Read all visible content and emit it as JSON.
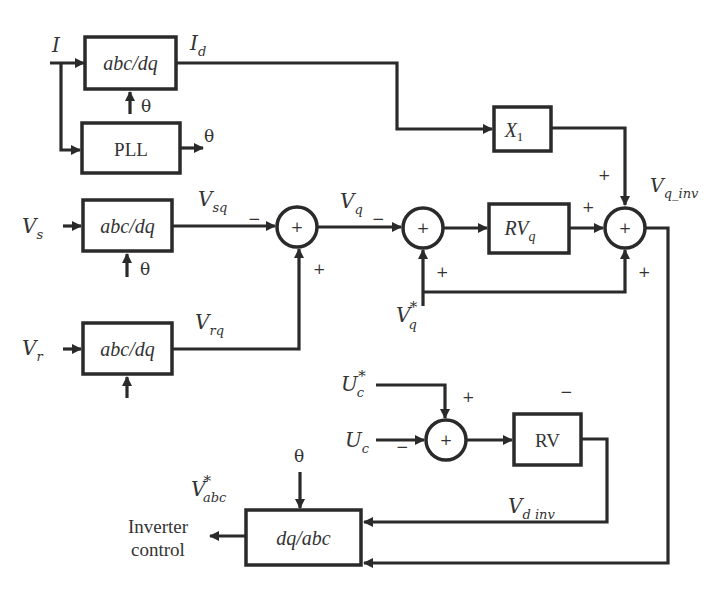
{
  "diagram": {
    "type": "control block diagram",
    "colors": {
      "line": "#2a2a2a",
      "text": "#333333",
      "background": "#ffffff"
    },
    "inputs": {
      "current": {
        "main": "I",
        "sub": ""
      },
      "vs": {
        "main": "V",
        "sub": "s"
      },
      "vr": {
        "main": "V",
        "sub": "r"
      },
      "vq_ref": {
        "main": "V",
        "sub": "q",
        "sup": "*"
      },
      "uc_ref": {
        "main": "U",
        "sub": "c",
        "sup": "*"
      },
      "uc": {
        "main": "U",
        "sub": "c"
      }
    },
    "blocks": {
      "abcdq_current": "abc/dq",
      "pll": "PLL",
      "abcdq_vs": "abc/dq",
      "abcdq_vr": "abc/dq",
      "x1": {
        "main": "X",
        "sub": "1"
      },
      "rvq": {
        "main": "RV",
        "sub": "q"
      },
      "rv": "RV",
      "dqabc": "dq/abc"
    },
    "signals": {
      "id": {
        "main": "I",
        "sub": "d"
      },
      "vsq": {
        "main": "V",
        "sub": "sq"
      },
      "vrq": {
        "main": "V",
        "sub": "rq"
      },
      "vq": {
        "main": "V",
        "sub": "q"
      },
      "vq_inv": {
        "main": "V",
        "sub": "q_inv"
      },
      "vd_inv": {
        "main": "V",
        "sub": "d inv"
      },
      "vabc_ref": {
        "main": "V",
        "sub": "abc",
        "sup": "*"
      },
      "theta": "θ"
    },
    "summing_junctions": {
      "sum_center_symbol": "+",
      "sum1": {
        "in_left": "−",
        "in_bottom": "+"
      },
      "sum2": {
        "in_left": "−",
        "in_bottom": "+"
      },
      "sum3": {
        "in_top": "+",
        "in_left": "+",
        "in_bottom": "+"
      },
      "sum4": {
        "in_top": "+",
        "in_left": "−"
      },
      "rv_note": "−"
    },
    "output": {
      "line1": "Inverter",
      "line2": "control"
    }
  }
}
